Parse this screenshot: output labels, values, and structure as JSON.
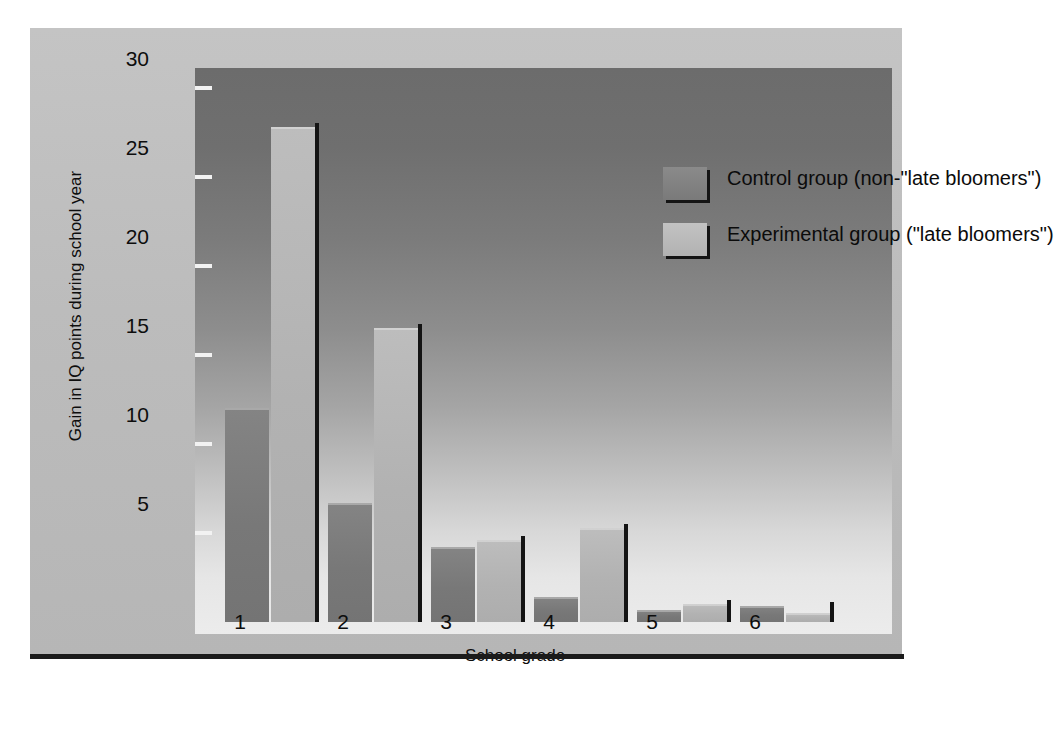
{
  "chart_data": {
    "type": "bar",
    "title": "",
    "xlabel": "School grade",
    "ylabel": "Gain in IQ points during school year",
    "categories": [
      "1",
      "2",
      "3",
      "4",
      "5",
      "6"
    ],
    "ylim": [
      0,
      31.5
    ],
    "yticks": [
      5,
      10,
      15,
      20,
      25,
      30
    ],
    "ytick_labels": [
      "5",
      "10",
      "15",
      "20",
      "25",
      "30"
    ],
    "grid": false,
    "legend_position": "upper right inside plot",
    "series": [
      {
        "name": "Control group (non-\"late bloomers\")",
        "color": "#7a7a7a",
        "values": [
          12.0,
          6.7,
          4.2,
          1.4,
          0.7,
          0.9
        ]
      },
      {
        "name": "Experimental group (\"late bloomers\")",
        "color": "#b2b2b2",
        "values": [
          27.8,
          16.5,
          4.6,
          5.3,
          1.0,
          0.5
        ]
      }
    ]
  },
  "legend": {
    "items": [
      {
        "label": "Control group (non-\"late bloomers\")",
        "swatch": "control"
      },
      {
        "label": "Experimental group (\"late bloomers\")",
        "swatch": "experimental"
      }
    ]
  },
  "axes": {
    "y_title": "Gain in IQ points during school year",
    "x_title": "School grade",
    "y_tick_labels": [
      "30",
      "25",
      "20",
      "15",
      "10",
      "5"
    ],
    "x_tick_labels": [
      "1",
      "2",
      "3",
      "4",
      "5",
      "6"
    ]
  },
  "colors": {
    "panel_background": "#bdbdbd",
    "plot_top": "#6c6c6c",
    "plot_bottom": "#ececec",
    "control_bar": "#7a7a7a",
    "experimental_bar": "#b2b2b2",
    "shadow": "#141414",
    "text": "#0d0d0d"
  }
}
